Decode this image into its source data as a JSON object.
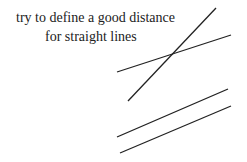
{
  "caption": {
    "line1": "try to define a good distance",
    "line2": "for straight lines"
  },
  "lines": [
    {
      "name": "steep-intersecting-line",
      "x1": 128,
      "y1": 101,
      "x2": 216,
      "y2": 8
    },
    {
      "name": "shallow-intersecting-line",
      "x1": 117,
      "y1": 72,
      "x2": 231,
      "y2": 35
    },
    {
      "name": "upper-parallel-line",
      "x1": 117,
      "y1": 137,
      "x2": 228,
      "y2": 89
    },
    {
      "name": "lower-parallel-line",
      "x1": 120,
      "y1": 153,
      "x2": 231,
      "y2": 106
    }
  ],
  "colors": {
    "line": "#222222",
    "background": "#ffffff"
  }
}
